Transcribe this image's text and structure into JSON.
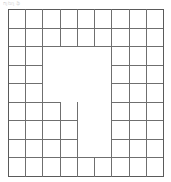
{
  "figure": {
    "kind": "grid-maze-diagram",
    "title_artifact": "ոյեղ ֆ",
    "colors": {
      "background": "#ffffff",
      "line": "#6f6f6f",
      "outer_line": "#5a5a5a",
      "artifact_text": "#b9b9b9"
    },
    "geometry": {
      "origin_x": 8,
      "origin_y": 9,
      "cell_width": 17.2,
      "cell_height": 18.6,
      "columns": 9,
      "rows": 9,
      "width": 155,
      "height": 167
    },
    "grid_x_positions": [
      8,
      25,
      42,
      60,
      77,
      94,
      111,
      129,
      146,
      163
    ],
    "grid_y_positions": [
      9,
      28,
      46,
      65,
      83,
      102,
      120,
      139,
      157,
      176
    ],
    "horizontal_segments": [
      {
        "name": "top-border",
        "row": 0,
        "col_start": 0,
        "col_end": 9
      },
      {
        "name": "row1-bottom",
        "row": 1,
        "col_start": 0,
        "col_end": 9
      },
      {
        "name": "row2-bottom",
        "row": 2,
        "col_start": 0,
        "col_end": 9
      },
      {
        "name": "row3-bottom-left",
        "row": 3,
        "col_start": 0,
        "col_end": 2
      },
      {
        "name": "row3-bottom-right",
        "row": 3,
        "col_start": 6,
        "col_end": 9
      },
      {
        "name": "row4-bottom-left",
        "row": 4,
        "col_start": 0,
        "col_end": 2
      },
      {
        "name": "row4-bottom-right",
        "row": 4,
        "col_start": 6,
        "col_end": 9
      },
      {
        "name": "row5-bottom-left",
        "row": 5,
        "col_start": 0,
        "col_end": 3
      },
      {
        "name": "row5-bottom-right",
        "row": 5,
        "col_start": 6,
        "col_end": 9
      },
      {
        "name": "row6-bottom-left",
        "row": 6,
        "col_start": 0,
        "col_end": 4
      },
      {
        "name": "row6-bottom-right",
        "row": 6,
        "col_start": 6,
        "col_end": 9
      },
      {
        "name": "row7-bottom-left",
        "row": 7,
        "col_start": 0,
        "col_end": 4
      },
      {
        "name": "row7-bottom-right",
        "row": 7,
        "col_start": 6,
        "col_end": 9
      },
      {
        "name": "row8-bottom",
        "row": 8,
        "col_start": 0,
        "col_end": 9
      },
      {
        "name": "bottom-border",
        "row": 9,
        "col_start": 0,
        "col_end": 9
      }
    ],
    "vertical_segments": [
      {
        "name": "left-border",
        "col": 0,
        "row_start": 0,
        "row_end": 9
      },
      {
        "name": "col1-top",
        "col": 1,
        "row_start": 0,
        "row_end": 9
      },
      {
        "name": "col2-upper",
        "col": 2,
        "row_start": 0,
        "row_end": 2
      },
      {
        "name": "col2-lower",
        "col": 2,
        "row_start": 2,
        "row_end": 9
      },
      {
        "name": "col3-upper",
        "col": 3,
        "row_start": 0,
        "row_end": 2
      },
      {
        "name": "col3-lower",
        "col": 3,
        "row_start": 5,
        "row_end": 9
      },
      {
        "name": "col4-upper",
        "col": 4,
        "row_start": 0,
        "row_end": 2
      },
      {
        "name": "col4-lower",
        "col": 4,
        "row_start": 5,
        "row_end": 9
      },
      {
        "name": "col5-upper",
        "col": 5,
        "row_start": 0,
        "row_end": 2
      },
      {
        "name": "col5-stub",
        "col": 5,
        "row_start": 8,
        "row_end": 9
      },
      {
        "name": "col6-upper",
        "col": 6,
        "row_start": 0,
        "row_end": 2
      },
      {
        "name": "col6-lower",
        "col": 6,
        "row_start": 2,
        "row_end": 9
      },
      {
        "name": "col7-full",
        "col": 7,
        "row_start": 0,
        "row_end": 9
      },
      {
        "name": "col8-full",
        "col": 8,
        "row_start": 0,
        "row_end": 9
      },
      {
        "name": "right-border",
        "col": 9,
        "row_start": 0,
        "row_end": 9
      }
    ]
  }
}
